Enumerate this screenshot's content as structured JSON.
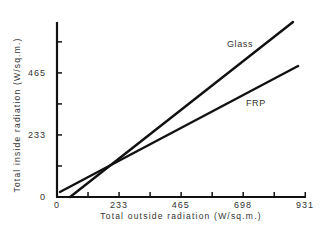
{
  "chart_data": {
    "type": "line",
    "title": "",
    "xlabel": "Total outside radiation (W/sq.m.)",
    "ylabel": "Total inside radiation (W/sq.m.)",
    "xlim": [
      0,
      931
    ],
    "ylim": [
      0,
      657
    ],
    "x_ticks": [
      0,
      233,
      465,
      698,
      931
    ],
    "y_ticks": [
      0,
      233,
      465
    ],
    "grid": false,
    "legend": "inline labels",
    "series": [
      {
        "name": "Glass",
        "x": [
          49,
          886
        ],
        "y": [
          0,
          657
        ]
      },
      {
        "name": "FRP",
        "x": [
          11,
          905
        ],
        "y": [
          19,
          492
        ]
      }
    ]
  },
  "labels": {
    "xlabel": "Total outside radiation (W/sq.m.)",
    "ylabel": "Total inside radiation (W/sq.m.)",
    "x_ticks": [
      "0",
      "233",
      "465",
      "698",
      "931"
    ],
    "y_ticks": [
      "0",
      "233",
      "465"
    ],
    "series": [
      "Glass",
      "FRP"
    ]
  }
}
